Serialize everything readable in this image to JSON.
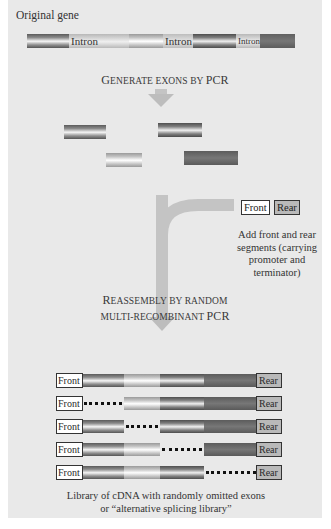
{
  "title": "Original gene",
  "gene": {
    "introns": [
      "Intron",
      "Intron",
      "Intron"
    ]
  },
  "steps": {
    "generate": {
      "cap1": "G",
      "rest1": "ENERATE EXONS BY ",
      "tail": "PCR"
    },
    "reassembly": {
      "line1_cap": "R",
      "line1_rest": "EASSEMBLY BY RANDOM",
      "line2_rest": "MULTI-RECOMBINANT ",
      "line2_tail": "PCR"
    }
  },
  "segments": {
    "front_label": "Front",
    "rear_label": "Rear",
    "note": [
      "Add front and rear",
      "segments (carrying",
      "promoter and",
      "terminator)"
    ]
  },
  "library_rows": [
    {
      "front": "Front",
      "rear": "Rear",
      "omitted": "none"
    },
    {
      "front": "Front",
      "rear": "Rear",
      "omitted": "exon 1"
    },
    {
      "front": "Front",
      "rear": "Rear",
      "omitted": "exon 2"
    },
    {
      "front": "Front",
      "rear": "Rear",
      "omitted": "exon 3"
    },
    {
      "front": "Front",
      "rear": "Rear",
      "omitted": "exon 4"
    }
  ],
  "caption": [
    "Library of cDNA with randomly omitted exons",
    "or “alternative splicing library”"
  ],
  "colors": {
    "panel": "#e9e9e9",
    "arrow": "#c4c4c4",
    "rear_box": "#b9b9b9"
  }
}
